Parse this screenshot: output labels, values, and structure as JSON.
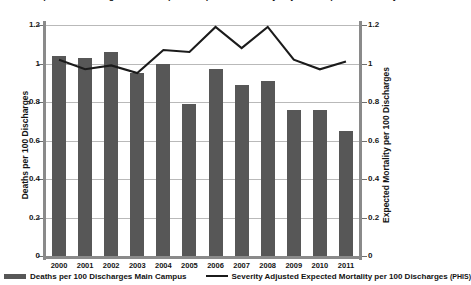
{
  "chart_data": {
    "type": "bar",
    "title": "Deaths per 100 Discharges Main Campus Compared to Severity Adjusted Expected Mortality",
    "categories": [
      "2000",
      "2001",
      "2002",
      "2003",
      "2004",
      "2005",
      "2006",
      "2007",
      "2008",
      "2009",
      "2010",
      "2011"
    ],
    "xlabel": "",
    "ylabel": "Deaths per 100 Discharges",
    "y2label": "Expected Mortality per 100 Discharges",
    "ylim": [
      0,
      1.2
    ],
    "y2lim": [
      0,
      1.2
    ],
    "ytick_labels": [
      "0",
      "0.2",
      "0.4",
      "0.6",
      "0.8",
      "1",
      "1.2"
    ],
    "ytick_values": [
      0,
      0.2,
      0.4,
      0.6,
      0.8,
      1,
      1.2
    ],
    "y2tick_labels": [
      "0",
      "0.2",
      "0.4",
      "0.6",
      "0.8",
      "1",
      "1.2"
    ],
    "y2tick_values": [
      0,
      0.2,
      0.4,
      0.6,
      0.8,
      1,
      1.2
    ],
    "grid": true,
    "legend_position": "bottom",
    "series": [
      {
        "name": "Deaths per 100 Discharges Main Campus",
        "type": "bar",
        "axis": "left",
        "color": "#575757",
        "values": [
          1.04,
          1.03,
          1.06,
          0.95,
          1.0,
          0.79,
          0.97,
          0.89,
          0.91,
          0.76,
          0.76,
          0.65
        ]
      },
      {
        "name": "Severity Adjusted Expected Mortality per 100 Discharges (PHIS)",
        "type": "line",
        "axis": "right",
        "color": "#1b1b1b",
        "values": [
          1.02,
          0.97,
          0.99,
          0.95,
          1.07,
          1.06,
          1.19,
          1.08,
          1.19,
          1.02,
          0.97,
          1.01
        ]
      }
    ]
  },
  "legend": {
    "entries": [
      {
        "label": "Deaths per 100 Discharges Main Campus",
        "marker": "bar-swatch",
        "color": "#575757"
      },
      {
        "label": "Severity Adjusted Expected Mortality per 100 Discharges",
        "suffix": "(PHIS)",
        "marker": "line-swatch",
        "color": "#1b1b1b"
      }
    ]
  },
  "colors": {
    "bar": "#575757",
    "line": "#1b1b1b",
    "grid": "#b9b9b9",
    "axis": "#8a8a8a",
    "text": "#141414",
    "background": "#ffffff"
  }
}
